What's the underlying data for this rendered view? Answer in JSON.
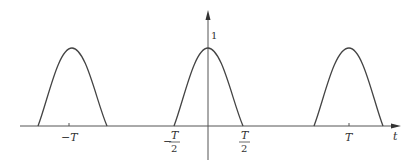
{
  "diagram": {
    "type": "periodic-pulse-waveform",
    "axes": {
      "x_label": "t",
      "y_peak_label": "1"
    },
    "tick_labels": {
      "neg_T": "−T",
      "neg_half_num": "T",
      "neg_half_den": "2",
      "neg_half_sign": "−",
      "pos_half_num": "T",
      "pos_half_den": "2",
      "pos_T": "T"
    },
    "pulses": [
      {
        "center": "-T",
        "start": "-5T/4",
        "end": "-3T/4"
      },
      {
        "center": "0",
        "start": "-T/2",
        "end": "T/2"
      },
      {
        "center": "T",
        "start": "3T/4",
        "end": "5T/4"
      }
    ],
    "colors": {
      "stroke": "#444444",
      "axis": "#555555",
      "text": "#333333"
    }
  }
}
